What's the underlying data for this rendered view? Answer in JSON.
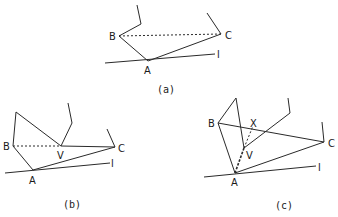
{
  "figure": {
    "panels": [
      {
        "id": "a",
        "caption": "(a)",
        "labels": {
          "A": "A",
          "B": "B",
          "C": "C",
          "l": "l"
        }
      },
      {
        "id": "b",
        "caption": "(b)",
        "labels": {
          "A": "A",
          "B": "B",
          "C": "C",
          "V": "V",
          "l": "l"
        }
      },
      {
        "id": "c",
        "caption": "(c)",
        "labels": {
          "A": "A",
          "B": "B",
          "C": "C",
          "V": "V",
          "X": "X",
          "l": "l"
        }
      }
    ]
  }
}
